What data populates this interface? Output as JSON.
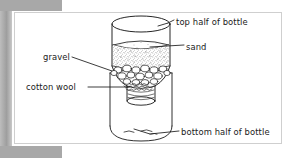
{
  "figure": {
    "background_color": "#ffffff",
    "frame_color": "#a8a8a8",
    "ink_color": "#1a1a1a"
  },
  "labels": [
    {
      "id": "top-half-of-bottle",
      "text": "top half of bottle",
      "position": "right",
      "points_to": "upper inverted bottle body"
    },
    {
      "id": "sand",
      "text": "sand",
      "position": "right",
      "points_to": "stippled sand layer"
    },
    {
      "id": "gravel",
      "text": "gravel",
      "position": "left",
      "points_to": "pebble layer below the sand"
    },
    {
      "id": "cotton-wool",
      "text": "cotton wool",
      "position": "left",
      "points_to": "cotton wool plug in the bottle neck"
    },
    {
      "id": "bottom-half-of-bottle",
      "text": "bottom half of bottle",
      "position": "right",
      "points_to": "lower bottle acting as a collecting vessel"
    }
  ],
  "diagram_parts": [
    {
      "id": "top-bottle",
      "name": "top half of bottle",
      "fill": "#ffffff"
    },
    {
      "id": "sand-layer",
      "name": "sand",
      "fill": "#f2f2f2"
    },
    {
      "id": "gravel-layer",
      "name": "gravel",
      "fill": "#ffffff"
    },
    {
      "id": "cotton-plug",
      "name": "cotton wool",
      "fill": "#ffffff"
    },
    {
      "id": "bottle-neck",
      "name": "bottle neck",
      "fill": "#ffffff"
    },
    {
      "id": "bottom-bottle",
      "name": "bottom half of bottle",
      "fill": "#ffffff"
    }
  ]
}
